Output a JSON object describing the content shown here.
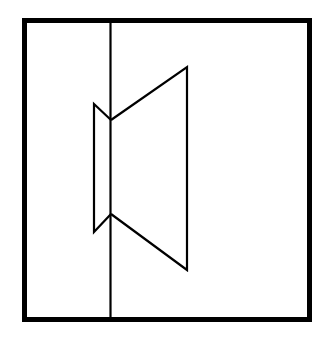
{
  "figure": {
    "type": "line-drawing",
    "background": "#ffffff",
    "stroke_color": "#000000",
    "frame": {
      "x1": 24.5,
      "y1": 20.5,
      "x2": 309.5,
      "y2": 319.5,
      "stroke_width": 5
    },
    "divider": {
      "x": 110.5,
      "y1": 20.5,
      "y2": 319.5,
      "stroke_width": 2.2
    },
    "small_trapezoid": {
      "points": [
        [
          111,
          120
        ],
        [
          94,
          104
        ],
        [
          94,
          232
        ],
        [
          111,
          214
        ]
      ]
    },
    "large_trapezoid": {
      "points": [
        [
          111,
          120
        ],
        [
          187,
          67
        ],
        [
          187,
          270
        ],
        [
          111,
          214
        ]
      ]
    }
  }
}
